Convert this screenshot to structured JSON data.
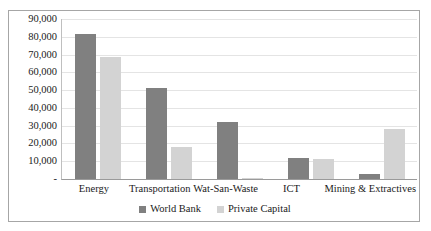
{
  "chart_data": {
    "type": "bar",
    "title": "",
    "subtitle": "",
    "xlabel": "",
    "ylabel": "",
    "ylim": [
      0,
      90000
    ],
    "ytick_step": 10000,
    "grid": true,
    "legend_position": "bottom",
    "categories": [
      "Energy",
      "Transportation",
      "Wat-San-Waste",
      "ICT",
      "Mining & Extractives"
    ],
    "ytick_labels": [
      "90,000",
      "80,000",
      "70,000",
      "60,000",
      "50,000",
      "40,000",
      "30,000",
      "20,000",
      "10,000",
      "-"
    ],
    "ytick_values": [
      90000,
      80000,
      70000,
      60000,
      50000,
      40000,
      30000,
      20000,
      10000,
      0
    ],
    "series": [
      {
        "name": "World Bank",
        "color": "#808080",
        "values": [
          81500,
          51000,
          32000,
          12000,
          3000
        ]
      },
      {
        "name": "Private Capital",
        "color": "#d3d3d3",
        "values": [
          68500,
          18000,
          500,
          11000,
          28000
        ]
      }
    ]
  },
  "legend": {
    "items": [
      {
        "label": "World Bank",
        "color": "#808080"
      },
      {
        "label": "Private Capital",
        "color": "#d3d3d3"
      }
    ]
  },
  "colors": {
    "world_bank": "#808080",
    "private_capital": "#d3d3d3",
    "gridline": "#e4e4e4",
    "border": "#a6a6a6",
    "text": "#1a1a1a",
    "background": "#ffffff"
  }
}
